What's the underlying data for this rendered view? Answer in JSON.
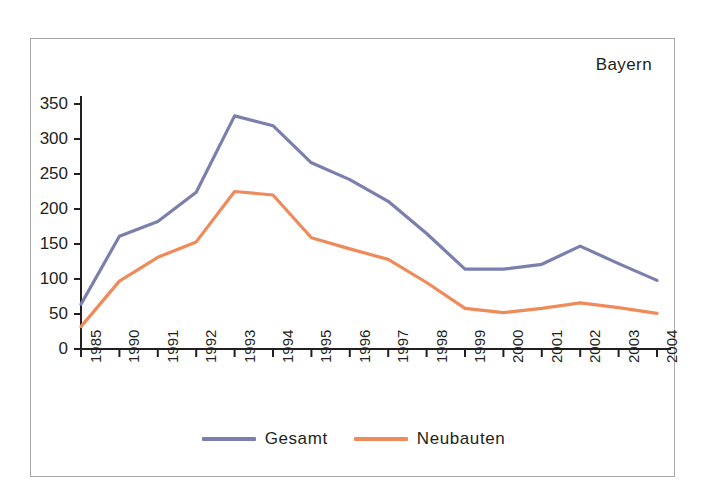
{
  "chart_data": {
    "type": "line",
    "title": "Bayern",
    "xlabel": "",
    "ylabel": "",
    "categories": [
      "1985",
      "1990",
      "1991",
      "1992",
      "1993",
      "1994",
      "1995",
      "1996",
      "1997",
      "1998",
      "1999",
      "2000",
      "2001",
      "2002",
      "2003",
      "2004"
    ],
    "yticks": [
      0,
      50,
      100,
      150,
      200,
      250,
      300,
      350
    ],
    "ylim": [
      0,
      350
    ],
    "grid": false,
    "legend_position": "bottom",
    "series": [
      {
        "name": "Gesamt",
        "color": "#7a7fad",
        "values": [
          64,
          161,
          182,
          224,
          333,
          319,
          266,
          242,
          211,
          165,
          114,
          114,
          121,
          147,
          122,
          98
        ]
      },
      {
        "name": "Neubauten",
        "color": "#ef8a5a",
        "values": [
          32,
          97,
          131,
          153,
          225,
          220,
          159,
          143,
          128,
          95,
          58,
          52,
          58,
          66,
          59,
          51
        ]
      }
    ]
  },
  "frame": {
    "border_color": "#a8a8a8",
    "background": "#ffffff"
  },
  "axis": {
    "color": "#231f20"
  }
}
